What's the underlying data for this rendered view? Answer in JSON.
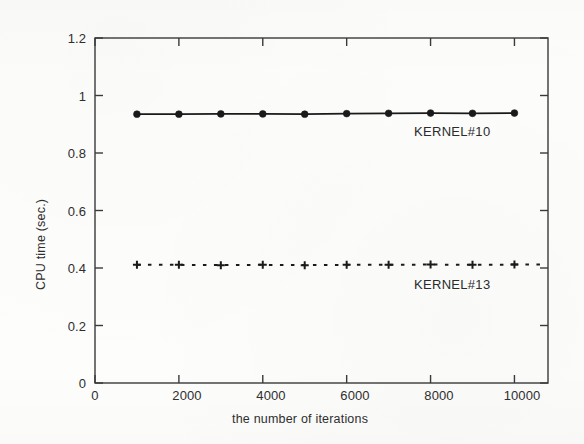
{
  "chart_data": {
    "type": "line",
    "title": "",
    "xlabel": "the number of iterations",
    "ylabel": "CPU time (sec.)",
    "xlim": [
      0,
      10800
    ],
    "ylim": [
      0,
      1.2
    ],
    "grid": false,
    "legend_position": "inline-right-of-series",
    "x_ticks": [
      0,
      2000,
      4000,
      6000,
      8000,
      10000
    ],
    "x_tick_labels": [
      "0",
      "2000",
      "4000",
      "6000",
      "8000",
      "10000"
    ],
    "y_ticks": [
      0,
      0.2,
      0.4,
      0.6,
      0.8,
      1,
      1.2
    ],
    "y_tick_labels": [
      "0",
      "0.2",
      "0.4",
      "0.6",
      "0.8",
      "1",
      "1.2"
    ],
    "x": [
      1000,
      2000,
      3000,
      4000,
      5000,
      6000,
      7000,
      8000,
      9000,
      10000
    ],
    "series": [
      {
        "name": "KERNEL#10",
        "label": "KERNEL#10",
        "marker": "filled-circle",
        "linestyle": "solid",
        "color": "#1a1a1a",
        "values": [
          0.935,
          0.935,
          0.936,
          0.936,
          0.935,
          0.937,
          0.938,
          0.939,
          0.938,
          0.939
        ]
      },
      {
        "name": "KERNEL#13",
        "label": "KERNEL#13",
        "marker": "plus",
        "linestyle": "dotted",
        "color": "#1a1a1a",
        "values": [
          0.411,
          0.411,
          0.41,
          0.411,
          0.41,
          0.411,
          0.411,
          0.412,
          0.411,
          0.412
        ]
      }
    ],
    "annotations": [
      {
        "text": "KERNEL#10",
        "x": 8050,
        "y": 0.875
      },
      {
        "text": "KERNEL#13",
        "x": 8050,
        "y": 0.345
      }
    ]
  },
  "axes": {
    "x_title": "the number of iterations",
    "y_title": "CPU time (sec.)"
  },
  "ticks": {
    "y": [
      {
        "label": "1.2",
        "value": 1.2
      },
      {
        "label": "1",
        "value": 1
      },
      {
        "label": "0.8",
        "value": 0.8
      },
      {
        "label": "0.6",
        "value": 0.6
      },
      {
        "label": "0.4",
        "value": 0.4
      },
      {
        "label": "0.2",
        "value": 0.2
      },
      {
        "label": "0",
        "value": 0
      }
    ],
    "x": [
      {
        "label": "0",
        "value": 0
      },
      {
        "label": "2000",
        "value": 2000
      },
      {
        "label": "4000",
        "value": 4000
      },
      {
        "label": "6000",
        "value": 6000
      },
      {
        "label": "8000",
        "value": 8000
      },
      {
        "label": "10000",
        "value": 10000
      }
    ]
  },
  "series_labels": {
    "kernel10": "KERNEL#10",
    "kernel13": "KERNEL#13"
  },
  "colors": {
    "ink": "#1a1a1a",
    "axis": "#3a3a3a",
    "text": "#2e2e2e",
    "paper": "#fdfdfc"
  }
}
